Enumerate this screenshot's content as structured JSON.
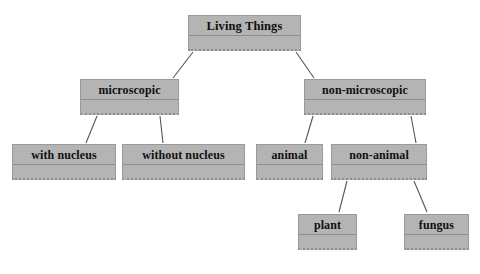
{
  "diagram": {
    "type": "hierarchy-tree",
    "colors": {
      "node_fill": "#b4b4b4",
      "node_border": "#9a9a9a",
      "node_rule": "#8d8d8d",
      "connector": "#555555",
      "text": "#101010",
      "background": "#ffffff"
    },
    "nodes": [
      {
        "id": "living-things",
        "label": "Living Things",
        "level": 0,
        "x": 188,
        "y": 15,
        "w": 113,
        "h": 36
      },
      {
        "id": "microscopic",
        "label": "microscopic",
        "level": 1,
        "x": 80,
        "y": 79,
        "w": 99,
        "h": 36
      },
      {
        "id": "non-microscopic",
        "label": "non-microscopic",
        "level": 1,
        "x": 304,
        "y": 79,
        "w": 122,
        "h": 36
      },
      {
        "id": "with-nucleus",
        "label": "with nucleus",
        "level": 2,
        "x": 12,
        "y": 144,
        "w": 104,
        "h": 36
      },
      {
        "id": "without-nucleus",
        "label": "without nucleus",
        "level": 2,
        "x": 122,
        "y": 144,
        "w": 123,
        "h": 36
      },
      {
        "id": "animal",
        "label": "animal",
        "level": 2,
        "x": 256,
        "y": 144,
        "w": 67,
        "h": 36
      },
      {
        "id": "non-animal",
        "label": "non-animal",
        "level": 2,
        "x": 331,
        "y": 144,
        "w": 96,
        "h": 36
      },
      {
        "id": "plant",
        "label": "plant",
        "level": 3,
        "x": 298,
        "y": 214,
        "w": 59,
        "h": 36
      },
      {
        "id": "fungus",
        "label": "fungus",
        "level": 3,
        "x": 404,
        "y": 214,
        "w": 65,
        "h": 36
      }
    ],
    "edges": [
      {
        "from": "living-things",
        "to": "microscopic",
        "x1": 193,
        "y1": 52,
        "x2": 173,
        "y2": 78
      },
      {
        "from": "living-things",
        "to": "non-microscopic",
        "x1": 296,
        "y1": 52,
        "x2": 314,
        "y2": 78
      },
      {
        "from": "microscopic",
        "to": "with-nucleus",
        "x1": 97,
        "y1": 116,
        "x2": 86,
        "y2": 143
      },
      {
        "from": "microscopic",
        "to": "without-nucleus",
        "x1": 160,
        "y1": 116,
        "x2": 163,
        "y2": 143
      },
      {
        "from": "non-microscopic",
        "to": "animal",
        "x1": 313,
        "y1": 116,
        "x2": 305,
        "y2": 143
      },
      {
        "from": "non-microscopic",
        "to": "non-animal",
        "x1": 411,
        "y1": 116,
        "x2": 416,
        "y2": 143
      },
      {
        "from": "non-animal",
        "to": "plant",
        "x1": 347,
        "y1": 181,
        "x2": 339,
        "y2": 212
      },
      {
        "from": "non-animal",
        "to": "fungus",
        "x1": 414,
        "y1": 181,
        "x2": 427,
        "y2": 212
      }
    ]
  }
}
